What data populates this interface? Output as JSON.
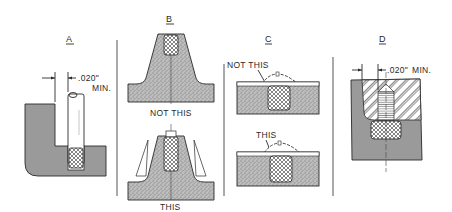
{
  "figure": {
    "panels": [
      {
        "id": "A",
        "label": "A",
        "dimension": {
          "value": ".020\"",
          "suffix": "MIN."
        }
      },
      {
        "id": "B",
        "label": "B",
        "captions": {
          "top": "NOT THIS",
          "bottom": "THIS"
        }
      },
      {
        "id": "C",
        "label": "C",
        "captions": {
          "top": "NOT THIS",
          "bottom": "THIS"
        }
      },
      {
        "id": "D",
        "label": "D",
        "dimension": {
          "value": ".020\"",
          "suffix": "MIN."
        }
      }
    ],
    "colors": {
      "ink": "#2a2a2a",
      "solid_gray": "#9a9a9a",
      "stipple_gray": "#b5b5b5",
      "background": "#ffffff"
    }
  }
}
